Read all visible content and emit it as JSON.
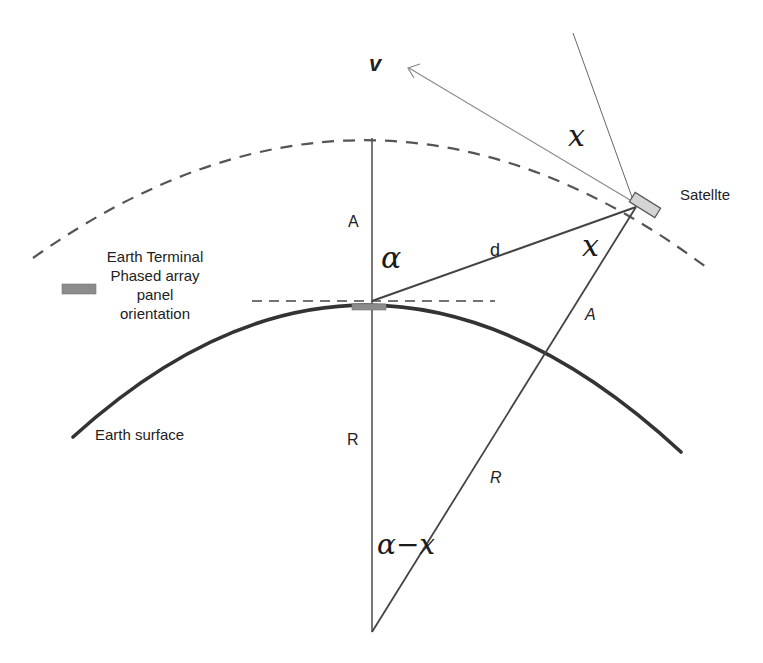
{
  "diagram": {
    "labels": {
      "velocity": "v",
      "satellite": "Satellte",
      "terminal_line1": "Earth Terminal",
      "terminal_line2": "Phased array",
      "terminal_line3": "panel",
      "terminal_line4": "orientation",
      "earth_surface": "Earth surface",
      "altitude_vertical": "A",
      "altitude_slant": "A",
      "radius_vertical": "R",
      "radius_slant": "R",
      "distance": "d",
      "angle_alpha": "α",
      "angle_x_top": "x",
      "angle_x_sat": "x",
      "angle_alpha_minus_x": "α−x"
    },
    "colors": {
      "line": "#555555",
      "earth_surface": "#333333",
      "orbit_dash": "#555555",
      "panel_fill": "#8c8c8c",
      "satellite_fill": "#d4d4d4",
      "velocity_label": "#707070"
    }
  }
}
